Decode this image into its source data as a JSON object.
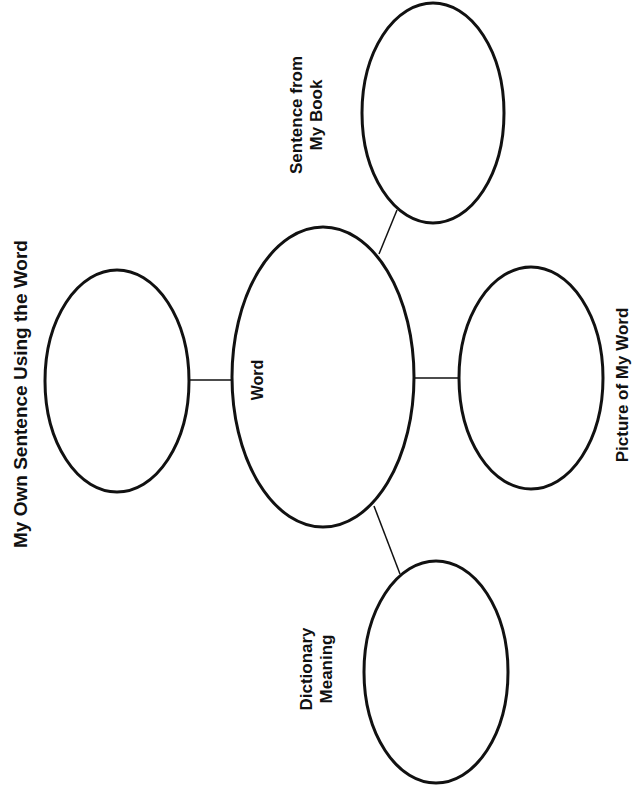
{
  "diagram": {
    "type": "vocabulary word map",
    "colors": {
      "stroke": "#111111",
      "background": "#ffffff",
      "text": "#111111"
    },
    "center": {
      "label": "Word"
    },
    "nodes": [
      {
        "id": "own-sentence",
        "label": "My Own Sentence Using the Word"
      },
      {
        "id": "sentence-book",
        "line1": "Sentence from",
        "line2": "My Book"
      },
      {
        "id": "picture",
        "label": "Picture of My Word"
      },
      {
        "id": "dictionary",
        "line1": "Dictionary",
        "line2": "Meaning"
      }
    ]
  }
}
